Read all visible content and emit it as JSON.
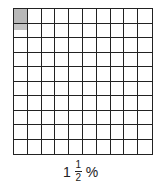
{
  "grid": {
    "rows": 10,
    "cols": 10,
    "shaded_full": [
      [
        0,
        0
      ]
    ],
    "shaded_half": [
      [
        1,
        0
      ]
    ],
    "shade_color": "#b8b8b8"
  },
  "label": {
    "whole": "1",
    "numerator": "1",
    "denominator": "2",
    "unit": "%"
  }
}
